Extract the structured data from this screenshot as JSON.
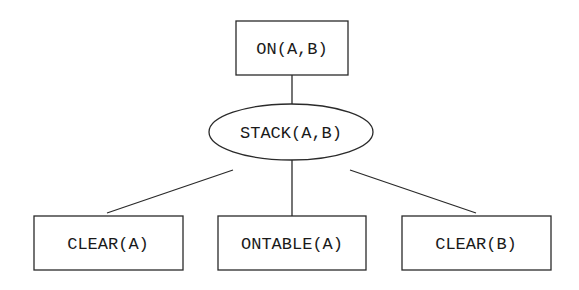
{
  "diagram": {
    "type": "tree",
    "root": {
      "id": "on_a_b",
      "label": "ON(A,B)",
      "shape": "rectangle",
      "children": [
        "stack_a_b"
      ]
    },
    "nodes": [
      {
        "id": "on_a_b",
        "label": "ON(A,B)",
        "shape": "rectangle"
      },
      {
        "id": "stack_a_b",
        "label": "STACK(A,B)",
        "shape": "ellipse"
      },
      {
        "id": "clear_a",
        "label": "CLEAR(A)",
        "shape": "rectangle"
      },
      {
        "id": "ontable_a",
        "label": "ONTABLE(A)",
        "shape": "rectangle"
      },
      {
        "id": "clear_b",
        "label": "CLEAR(B)",
        "shape": "rectangle"
      }
    ],
    "edges": [
      {
        "from": "on_a_b",
        "to": "stack_a_b"
      },
      {
        "from": "stack_a_b",
        "to": "clear_a"
      },
      {
        "from": "stack_a_b",
        "to": "ontable_a"
      },
      {
        "from": "stack_a_b",
        "to": "clear_b"
      }
    ],
    "colors": {
      "stroke": "#2a2a2a",
      "text": "#1a1a1a",
      "background": "#ffffff"
    }
  }
}
